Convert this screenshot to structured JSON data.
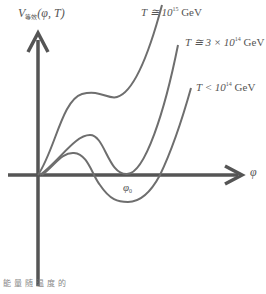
{
  "diagram": {
    "y_axis_label": {
      "main": "V",
      "sub": "等效",
      "args": "(φ, T)"
    },
    "x_axis_label": "φ",
    "min_label": {
      "main": "φ",
      "sub": "0"
    },
    "curves": [
      {
        "name": "T ≅ 10^15 GeV",
        "prefix": "T ≅ 10",
        "exp": "15",
        "suffix": " GeV"
      },
      {
        "name": "T ≅ 3 × 10^14 GeV",
        "prefix": "T ≅ 3 × 10",
        "exp": "14",
        "suffix": " GeV"
      },
      {
        "name": "T < 10^14 GeV",
        "prefix": "T < 10",
        "exp": "14",
        "suffix": " GeV"
      }
    ],
    "caption": "能量随温度的",
    "colors": {
      "axis": "#555555",
      "curve": "#6e6e6e",
      "text": "#555555"
    }
  }
}
